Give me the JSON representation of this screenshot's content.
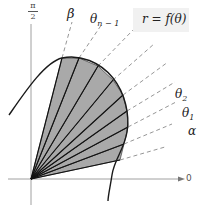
{
  "figure": {
    "equation_label": "r = f(θ)",
    "axis_labels": {
      "polar_axis": "0",
      "vertical_axis_numerator": "π",
      "vertical_axis_denominator": "2"
    },
    "angle_labels": [
      {
        "name": "beta",
        "text": "β",
        "sub": ""
      },
      {
        "name": "theta-n-minus-1",
        "text": "θ",
        "sub": "n − 1"
      },
      {
        "name": "theta-2",
        "text": "θ",
        "sub": "2"
      },
      {
        "name": "theta-1",
        "text": "θ",
        "sub": "1"
      },
      {
        "name": "alpha",
        "text": "α",
        "sub": ""
      }
    ],
    "colors": {
      "sector_fill": "#a9a9a9",
      "curve": "#1a1a1a",
      "ray": "#111111",
      "dashed_ray": "#8a8a8a",
      "axis": "#777777",
      "equation_box": "#f1f1f1"
    },
    "origin": {
      "x": 31,
      "y": 179
    },
    "ray_endpoints": [
      {
        "x": 120,
        "y": 160
      },
      {
        "x": 124,
        "y": 144
      },
      {
        "x": 128,
        "y": 127
      },
      {
        "x": 127,
        "y": 111
      },
      {
        "x": 123,
        "y": 95
      },
      {
        "x": 113,
        "y": 80
      },
      {
        "x": 98,
        "y": 66
      },
      {
        "x": 79,
        "y": 58
      },
      {
        "x": 62,
        "y": 58
      }
    ],
    "dashed_extensions": [
      {
        "x": 165,
        "y": 147
      },
      {
        "x": 172,
        "y": 124
      },
      {
        "x": 176,
        "y": 102
      },
      {
        "x": 175,
        "y": 82
      },
      {
        "x": 168,
        "y": 62
      },
      {
        "x": 154,
        "y": 44
      },
      {
        "x": 133,
        "y": 30
      },
      {
        "x": 102,
        "y": 24
      },
      {
        "x": 72,
        "y": 22
      }
    ]
  }
}
